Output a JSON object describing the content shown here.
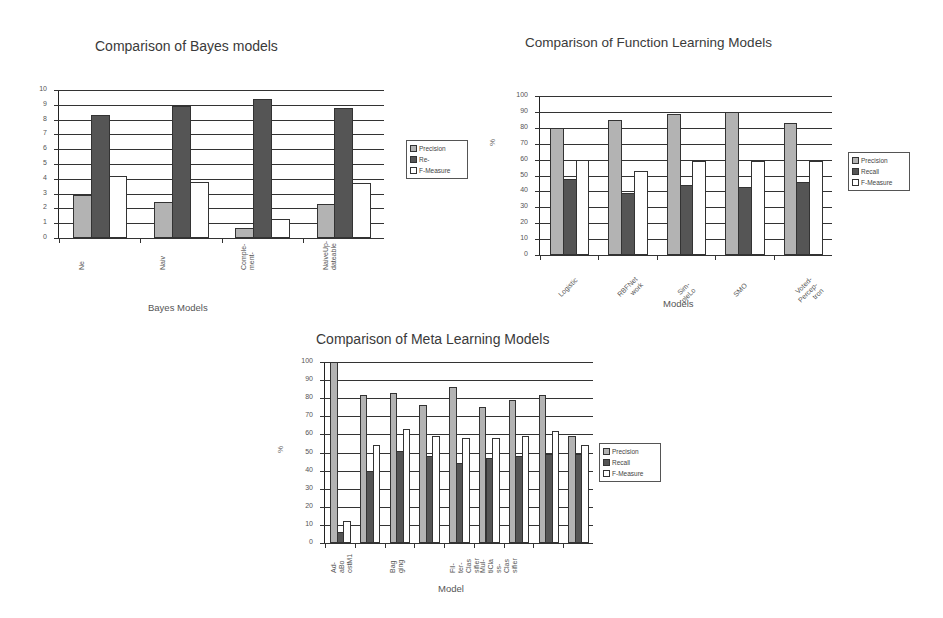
{
  "colors": {
    "precision": "#b3b3b3",
    "recall": "#555555",
    "f_measure": "#ffffff"
  },
  "bayes": {
    "title": "Comparison of Bayes models",
    "xlabel": "Bayes Models",
    "legend": [
      "Precision",
      "Re-",
      "F-Measure"
    ],
    "yticks": [
      "0",
      "1",
      "2",
      "3",
      "4",
      "5",
      "6",
      "7",
      "8",
      "9",
      "10"
    ],
    "categories": [
      "Ne",
      "Naiv",
      "Comple-\nment-",
      "NaiveUp-\ndateable"
    ]
  },
  "func": {
    "title": "Comparison of Function Learning Models",
    "xlabel": "Models",
    "ylabel": "%",
    "legend": [
      "Precision",
      "Recall",
      "F-Measure"
    ],
    "yticks": [
      "0",
      "10",
      "20",
      "30",
      "40",
      "50",
      "60",
      "70",
      "80",
      "90",
      "100"
    ],
    "categories": [
      "Logistic",
      "RBFNet\nwork",
      "Sim-\npleLo",
      "SMO",
      "Voted-\nPercep-\ntron"
    ]
  },
  "meta": {
    "title": "Comparison of Meta Learning Models",
    "xlabel": "Model",
    "ylabel": "%",
    "legend": [
      "Precision",
      "Recall",
      "F-Measure"
    ],
    "yticks": [
      "0",
      "10",
      "20",
      "30",
      "40",
      "50",
      "60",
      "70",
      "80",
      "90",
      "100"
    ],
    "categories": [
      "Ad-\naBo\nostM1",
      "",
      "Bag\nging",
      "",
      "Fil-\nter-\nClas\nsifier",
      "Mul-\ntiCla\nss-\nClas\nsifier",
      "",
      "",
      ""
    ]
  },
  "chart_data": [
    {
      "type": "bar",
      "title": "Comparison of Bayes models",
      "xlabel": "Bayes Models",
      "ylabel": "",
      "ylim": [
        0,
        10
      ],
      "grid": true,
      "legend_position": "right",
      "categories": [
        "Ne",
        "Naiv",
        "Comple-ment-",
        "NaiveUp-dateable"
      ],
      "series": [
        {
          "name": "Precision",
          "values": [
            2.9,
            2.4,
            0.7,
            2.3
          ]
        },
        {
          "name": "Re-",
          "values": [
            8.3,
            8.9,
            9.4,
            8.8
          ]
        },
        {
          "name": "F-Measure",
          "values": [
            4.2,
            3.8,
            1.3,
            3.7
          ]
        }
      ]
    },
    {
      "type": "bar",
      "title": "Comparison of Function Learning Models",
      "xlabel": "Models",
      "ylabel": "%",
      "ylim": [
        0,
        100
      ],
      "grid": true,
      "legend_position": "right",
      "categories": [
        "Logistic",
        "RBFNetwork",
        "SimpleLo",
        "SMO",
        "Voted-Perceptron"
      ],
      "series": [
        {
          "name": "Precision",
          "values": [
            80,
            85,
            89,
            90,
            83
          ]
        },
        {
          "name": "Recall",
          "values": [
            48,
            39,
            44,
            43,
            46
          ]
        },
        {
          "name": "F-Measure",
          "values": [
            60,
            53,
            59,
            59,
            59
          ]
        }
      ]
    },
    {
      "type": "bar",
      "title": "Comparison of Meta Learning Models",
      "xlabel": "Model",
      "ylabel": "%",
      "ylim": [
        0,
        100
      ],
      "grid": true,
      "legend_position": "right",
      "categories": [
        "AdaBoostM1",
        "Model 2",
        "Bagging",
        "Model 4",
        "FilterClassifier",
        "MultiClassClassifier",
        "Model 7",
        "Model 8",
        "Model 9"
      ],
      "series": [
        {
          "name": "Precision",
          "values": [
            100,
            82,
            83,
            76,
            86,
            75,
            79,
            82,
            59
          ]
        },
        {
          "name": "Recall",
          "values": [
            6,
            40,
            51,
            48,
            44,
            47,
            48,
            49,
            49
          ]
        },
        {
          "name": "F-Measure",
          "values": [
            12,
            54,
            63,
            59,
            58,
            58,
            59,
            62,
            54
          ]
        }
      ]
    }
  ]
}
